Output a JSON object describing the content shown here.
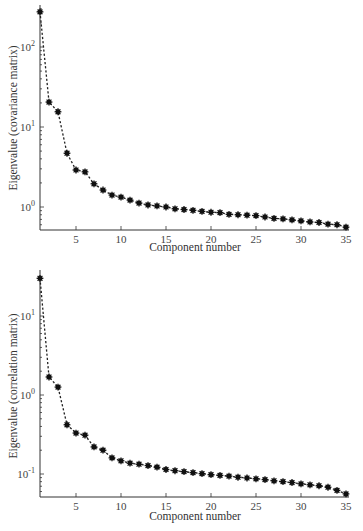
{
  "chart_data": [
    {
      "type": "line",
      "title": "",
      "xlabel": "Component number",
      "ylabel": "Eigenvalue (covariance matrix)",
      "yscale": "log",
      "grid": false,
      "legend": null,
      "marker": "asterisk",
      "linestyle": "dashed",
      "xlim": [
        1,
        35
      ],
      "ylim_log10": [
        -0.3,
        2.5
      ],
      "xticks": [
        5,
        10,
        15,
        20,
        25,
        30,
        35
      ],
      "yticks": [
        {
          "exp": 0,
          "label": "10^0"
        },
        {
          "exp": 1,
          "label": "10^1"
        },
        {
          "exp": 2,
          "label": "10^2"
        }
      ],
      "x": [
        1,
        2,
        3,
        4,
        5,
        6,
        7,
        8,
        9,
        10,
        11,
        12,
        13,
        14,
        15,
        16,
        17,
        18,
        19,
        20,
        21,
        22,
        23,
        24,
        25,
        26,
        27,
        28,
        29,
        30,
        31,
        32,
        33,
        34,
        35
      ],
      "values": [
        275,
        20.5,
        15.5,
        4.7,
        2.9,
        2.75,
        1.95,
        1.63,
        1.41,
        1.33,
        1.22,
        1.12,
        1.06,
        1.03,
        1.0,
        0.95,
        0.93,
        0.91,
        0.88,
        0.86,
        0.85,
        0.81,
        0.8,
        0.79,
        0.78,
        0.75,
        0.72,
        0.71,
        0.69,
        0.67,
        0.65,
        0.64,
        0.61,
        0.6,
        0.56
      ]
    },
    {
      "type": "line",
      "title": "",
      "xlabel": "Component number",
      "ylabel": "Eigenvalue (correlation matrix)",
      "yscale": "log",
      "grid": false,
      "legend": null,
      "marker": "asterisk",
      "linestyle": "dashed",
      "xlim": [
        1,
        35
      ],
      "ylim_log10": [
        -1.3,
        1.5
      ],
      "xticks": [
        5,
        10,
        15,
        20,
        25,
        30,
        35
      ],
      "yticks": [
        {
          "exp": -1,
          "label": "10^-1"
        },
        {
          "exp": 0,
          "label": "10^0"
        },
        {
          "exp": 1,
          "label": "10^1"
        }
      ],
      "x": [
        1,
        2,
        3,
        4,
        5,
        6,
        7,
        8,
        9,
        10,
        11,
        12,
        13,
        14,
        15,
        16,
        17,
        18,
        19,
        20,
        21,
        22,
        23,
        24,
        25,
        26,
        27,
        28,
        29,
        30,
        31,
        32,
        33,
        34,
        35
      ],
      "values": [
        30,
        1.69,
        1.26,
        0.42,
        0.33,
        0.31,
        0.22,
        0.2,
        0.16,
        0.147,
        0.137,
        0.133,
        0.128,
        0.122,
        0.114,
        0.11,
        0.107,
        0.104,
        0.101,
        0.098,
        0.096,
        0.094,
        0.091,
        0.089,
        0.087,
        0.085,
        0.082,
        0.08,
        0.078,
        0.075,
        0.073,
        0.071,
        0.068,
        0.062,
        0.056
      ]
    }
  ],
  "charts": [
    {
      "xlabel": "Component number",
      "ylabel": "Eigenvalue (covariance matrix)"
    },
    {
      "xlabel": "Component number",
      "ylabel": "Eigenvalue (correlation matrix)"
    }
  ]
}
